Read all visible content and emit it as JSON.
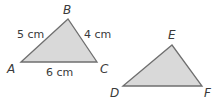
{
  "triangles": [
    {
      "name": "ABC",
      "vertices": {
        "A": {
          "label": "A",
          "x": 21,
          "y": 62
        },
        "B": {
          "label": "B",
          "x": 68,
          "y": 19
        },
        "C": {
          "label": "C",
          "x": 97,
          "y": 62
        }
      },
      "sides": {
        "AB": "5 cm",
        "BC": "4 cm",
        "AC": "6 cm"
      }
    },
    {
      "name": "DEF",
      "vertices": {
        "D": {
          "label": "D",
          "x": 123,
          "y": 86
        },
        "E": {
          "label": "E",
          "x": 172,
          "y": 45
        },
        "F": {
          "label": "F",
          "x": 202,
          "y": 86
        }
      }
    }
  ],
  "colors": {
    "fill": "#d9d9d9",
    "stroke": "#6f6f6f",
    "text": "#3a3a3a"
  }
}
